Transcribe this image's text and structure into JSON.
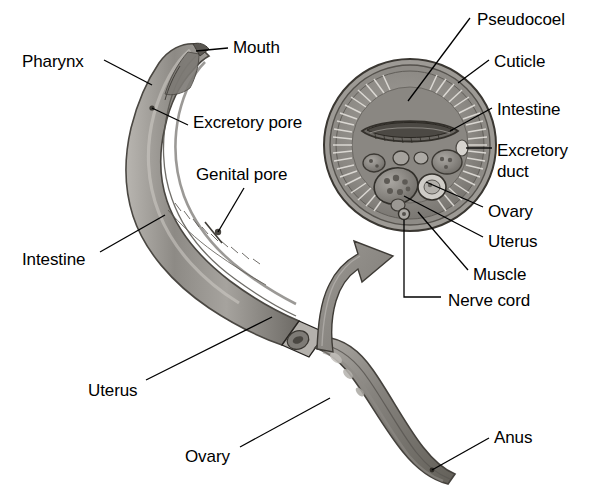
{
  "figure": {
    "organism": "female roundworm",
    "background_color": "#ffffff",
    "line_color": "#000000",
    "body_fill_color": "#9a9792",
    "body_dark_color": "#595651",
    "body_light_color": "#c9c6c0",
    "cross_section_fill": "#8c8a85",
    "cross_section_rim": "#6e6b66",
    "arrow_fill": "#8e8b86"
  },
  "labels": [
    {
      "id": "pharynx",
      "text": "Pharynx",
      "x": 22,
      "y": 52,
      "align": "left"
    },
    {
      "id": "mouth",
      "text": "Mouth",
      "x": 233,
      "y": 38,
      "align": "left"
    },
    {
      "id": "excretory_pore",
      "text": "Excretory pore",
      "x": 193,
      "y": 113,
      "align": "left"
    },
    {
      "id": "genital_pore",
      "text": "Genital pore",
      "x": 196,
      "y": 165,
      "align": "left"
    },
    {
      "id": "intestine_body",
      "text": "Intestine",
      "x": 22,
      "y": 250,
      "align": "left"
    },
    {
      "id": "uterus_body",
      "text": "Uterus",
      "x": 88,
      "y": 381,
      "align": "left"
    },
    {
      "id": "ovary_body",
      "text": "Ovary",
      "x": 185,
      "y": 447,
      "align": "left"
    },
    {
      "id": "anus",
      "text": "Anus",
      "x": 494,
      "y": 428,
      "align": "left"
    },
    {
      "id": "pseudocoel",
      "text": "Pseudocoel",
      "x": 477,
      "y": 10,
      "align": "left"
    },
    {
      "id": "cuticle",
      "text": "Cuticle",
      "x": 494,
      "y": 52,
      "align": "left"
    },
    {
      "id": "intestine_cs",
      "text": "Intestine",
      "x": 497,
      "y": 100,
      "align": "left"
    },
    {
      "id": "excretory_duct",
      "text": "Excretory",
      "x": 497,
      "y": 141,
      "align": "left"
    },
    {
      "id": "excretory_duct2",
      "text": "duct",
      "x": 497,
      "y": 162,
      "align": "left"
    },
    {
      "id": "ovary_cs",
      "text": "Ovary",
      "x": 488,
      "y": 202,
      "align": "left"
    },
    {
      "id": "uterus_cs",
      "text": "Uterus",
      "x": 488,
      "y": 232,
      "align": "left"
    },
    {
      "id": "muscle",
      "text": "Muscle",
      "x": 473,
      "y": 265,
      "align": "left"
    },
    {
      "id": "nerve_cord",
      "text": "Nerve cord",
      "x": 448,
      "y": 291,
      "align": "left"
    }
  ],
  "leader_lines": [
    {
      "id": "pharynx-leader",
      "from": [
        104,
        60
      ],
      "to": [
        152,
        85
      ]
    },
    {
      "id": "mouth-leader",
      "from": [
        228,
        48
      ],
      "to": [
        196,
        51
      ]
    },
    {
      "id": "excretory-pore-leader",
      "from": [
        188,
        125
      ],
      "to": [
        152,
        108
      ]
    },
    {
      "id": "genital-pore-leader",
      "from": [
        244,
        188
      ],
      "to": [
        218,
        232
      ]
    },
    {
      "id": "intestine-body-leader",
      "from": [
        100,
        252
      ],
      "to": [
        165,
        215
      ]
    },
    {
      "id": "uterus-body-leader",
      "from": [
        146,
        380
      ],
      "to": [
        272,
        317
      ]
    },
    {
      "id": "ovary-body-leader",
      "from": [
        240,
        447
      ],
      "to": [
        330,
        398
      ]
    },
    {
      "id": "anus-leader",
      "from": [
        489,
        438
      ],
      "to": [
        432,
        470
      ]
    },
    {
      "id": "pseudocoel-leader",
      "from": [
        470,
        18
      ],
      "to": [
        408,
        101
      ]
    },
    {
      "id": "cuticle-leader",
      "from": [
        489,
        60
      ],
      "to": [
        458,
        83
      ]
    },
    {
      "id": "intestine-cs-leader",
      "from": [
        492,
        108
      ],
      "to": [
        450,
        131
      ]
    },
    {
      "id": "excretory-duct-leader",
      "from": [
        492,
        148
      ],
      "to": [
        465,
        148
      ]
    },
    {
      "id": "ovary-cs-leader",
      "from": [
        483,
        207
      ],
      "to": [
        426,
        182
      ]
    },
    {
      "id": "uterus-cs-leader",
      "from": [
        483,
        237
      ],
      "to": [
        408,
        198
      ]
    },
    {
      "id": "muscle-leader",
      "from": [
        468,
        270
      ],
      "to": [
        420,
        215
      ]
    },
    {
      "id": "nerve-cord-leader",
      "from": [
        441,
        297
      ],
      "to": [
        404,
        297
      ],
      "elbow": [
        404,
        216
      ]
    }
  ],
  "cross_section": {
    "center": [
      410,
      145
    ],
    "radius": 87,
    "structures": [
      {
        "name": "cuticle",
        "note": "outer ring"
      },
      {
        "name": "muscle",
        "note": "inner striated band"
      },
      {
        "name": "pseudocoel",
        "note": "body cavity"
      },
      {
        "name": "intestine",
        "note": "large lens-shaped organ, upper center"
      },
      {
        "name": "excretory-duct",
        "note": "right lateral line"
      },
      {
        "name": "ovary",
        "note": "round organ, lower right of center"
      },
      {
        "name": "uterus",
        "note": "large organ, lower left of center"
      },
      {
        "name": "nerve-cord",
        "note": "small ventral node, bottom"
      }
    ]
  },
  "worm": {
    "anterior_segment": "curved head and pharynx region, upper left",
    "posterior_segment": "tail region, lower right, ending at anus",
    "cut_plane_marker": "small parallelogram at mid-body showing the plane of section"
  },
  "connector_arrow": {
    "id": "section-arrow",
    "description": "curved arrow from cut body section up to cross section circle"
  }
}
